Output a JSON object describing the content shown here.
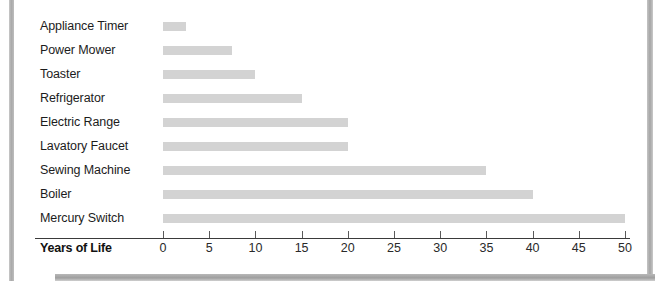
{
  "chart_data": {
    "type": "bar",
    "orientation": "horizontal",
    "title": "",
    "xlabel": "Years of Life",
    "ylabel": "",
    "xlim": [
      0,
      50
    ],
    "xticks": [
      0,
      5,
      10,
      15,
      20,
      25,
      30,
      35,
      40,
      45,
      50
    ],
    "grid": false,
    "legend": null,
    "bar_color": "#d3d3d3",
    "categories": [
      "Appliance Timer",
      "Power Mower",
      "Toaster",
      "Refrigerator",
      "Electric Range",
      "Lavatory Faucet",
      "Sewing Machine",
      "Boiler",
      "Mercury Switch"
    ],
    "values": [
      2.5,
      7.5,
      10,
      15,
      20,
      20,
      35,
      40,
      50
    ]
  }
}
